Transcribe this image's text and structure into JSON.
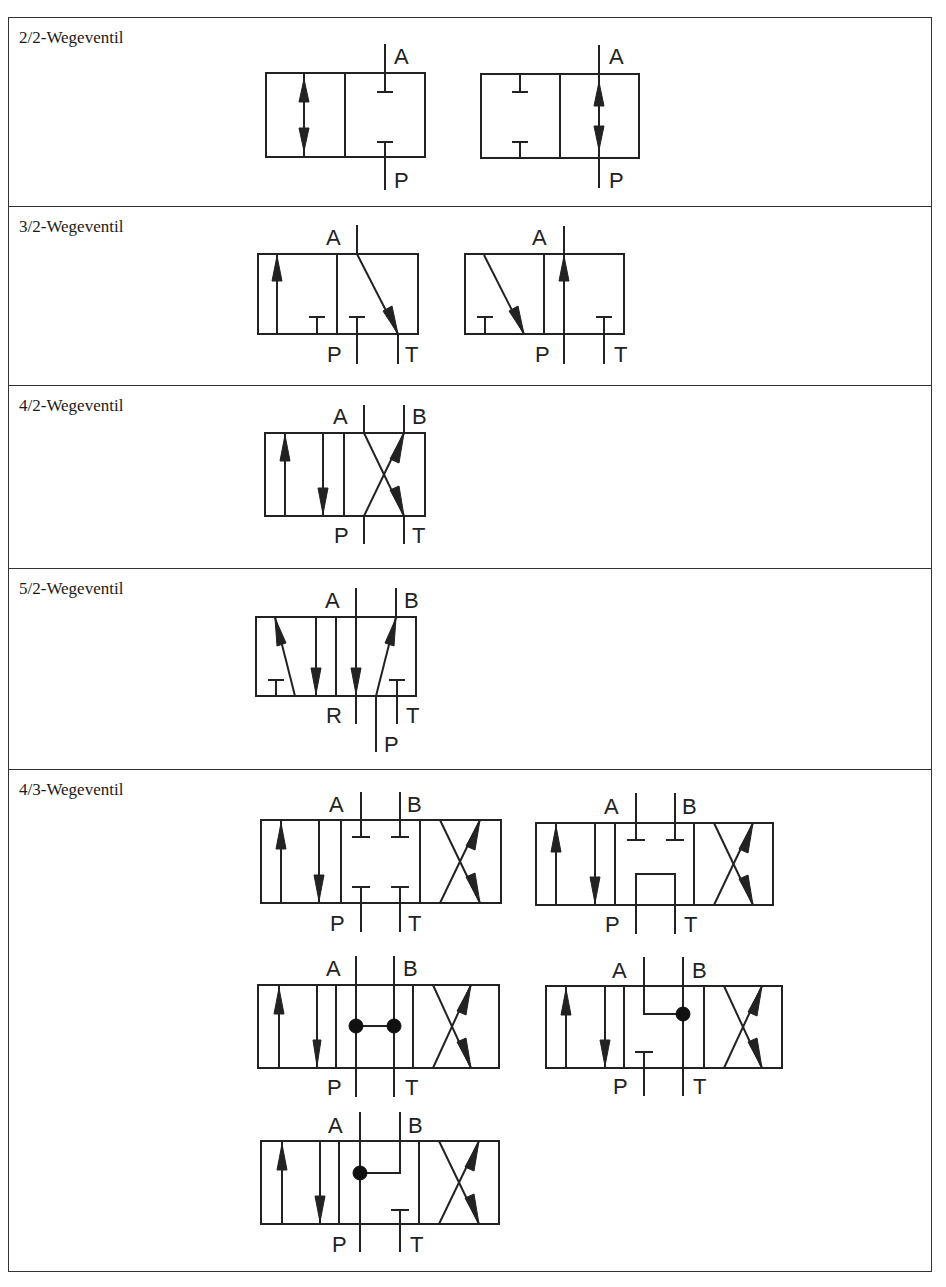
{
  "table": {
    "rows": [
      {
        "label": "2/2-Wegeventil",
        "symbols": [
          {
            "name": "2-2-valve-normally-closed",
            "ports": [
              "A",
              "P"
            ]
          },
          {
            "name": "2-2-valve-normally-open",
            "ports": [
              "A",
              "P"
            ]
          }
        ]
      },
      {
        "label": "3/2-Wegeventil",
        "symbols": [
          {
            "name": "3-2-valve-normally-closed",
            "ports": [
              "A",
              "P",
              "T"
            ]
          },
          {
            "name": "3-2-valve-normally-open",
            "ports": [
              "A",
              "P",
              "T"
            ]
          }
        ]
      },
      {
        "label": "4/2-Wegeventil",
        "symbols": [
          {
            "name": "4-2-valve",
            "ports": [
              "A",
              "B",
              "P",
              "T"
            ]
          }
        ]
      },
      {
        "label": "5/2-Wegeventil",
        "symbols": [
          {
            "name": "5-2-valve",
            "ports": [
              "A",
              "B",
              "R",
              "T",
              "P"
            ]
          }
        ]
      },
      {
        "label": "4/3-Wegeventil",
        "symbols": [
          {
            "name": "4-3-valve-closed-center",
            "ports": [
              "A",
              "B",
              "P",
              "T"
            ]
          },
          {
            "name": "4-3-valve-tandem-center",
            "ports": [
              "A",
              "B",
              "P",
              "T"
            ]
          },
          {
            "name": "4-3-valve-open-center",
            "ports": [
              "A",
              "B",
              "P",
              "T"
            ]
          },
          {
            "name": "4-3-valve-float-center-a",
            "ports": [
              "A",
              "B",
              "P",
              "T"
            ]
          },
          {
            "name": "4-3-valve-float-center-b",
            "ports": [
              "A",
              "B",
              "P",
              "T"
            ]
          }
        ]
      }
    ]
  },
  "ports": {
    "A": "A",
    "B": "B",
    "P": "P",
    "T": "T",
    "R": "R"
  }
}
